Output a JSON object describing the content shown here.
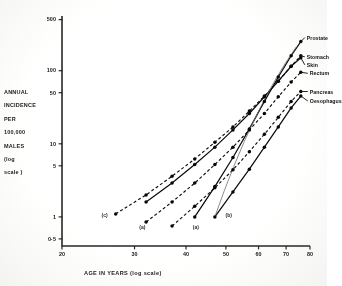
{
  "chart_data": {
    "type": "line",
    "title": "",
    "xlabel": "AGE  IN  YEARS (log scale)",
    "ylabel_lines": [
      "ANNUAL",
      "INCIDENCE",
      "PER",
      "100,000",
      "MALES",
      "(log",
      "scale )"
    ],
    "ylabel_full": "ANNUAL INCIDENCE PER 100,000 MALES (log scale)",
    "xscale": "log",
    "yscale": "log",
    "xlim": [
      20,
      80
    ],
    "ylim": [
      0.4,
      560
    ],
    "grid": false,
    "legend_position": "right-inline",
    "xticks": [
      20,
      30,
      40,
      50,
      60,
      70,
      80
    ],
    "xtick_labels": [
      "20",
      "30",
      "40",
      "50",
      "60",
      "70",
      "80"
    ],
    "yticks": [
      0.5,
      1,
      5,
      10,
      50,
      100,
      500
    ],
    "ytick_labels": [
      "0·5",
      "1",
      "5",
      "10",
      "50",
      "100",
      "500"
    ],
    "annotations": [
      {
        "text": "(c)",
        "x": 25.5,
        "y": 1.05
      },
      {
        "text": "(a)",
        "x": 31.5,
        "y": 0.72
      },
      {
        "text": "(a)",
        "x": 42.5,
        "y": 0.72
      },
      {
        "text": "(b)",
        "x": 51.0,
        "y": 1.05
      }
    ],
    "series": [
      {
        "name": "Prostate",
        "label": "Prostate",
        "style": "solid",
        "marker": "filled-circle",
        "x": [
          42,
          47,
          52,
          57,
          62,
          67,
          72,
          76
        ],
        "values": [
          1.0,
          2.6,
          6.5,
          16,
          38,
          82,
          160,
          250
        ]
      },
      {
        "name": "Stomach",
        "label": "Stomach",
        "style": "dashed",
        "marker": "filled-circle",
        "x": [
          27,
          32,
          37,
          42,
          47,
          52,
          57,
          62,
          67,
          72,
          76
        ],
        "values": [
          1.1,
          2.0,
          3.6,
          6.2,
          10.5,
          17,
          28,
          45,
          72,
          115,
          160
        ]
      },
      {
        "name": "Skin",
        "label": "Skin",
        "style": "solid",
        "marker": "filled-circle",
        "x": [
          32,
          37,
          42,
          47,
          52,
          57,
          62,
          67,
          72,
          76
        ],
        "values": [
          1.6,
          2.9,
          5.2,
          9.0,
          15.5,
          26,
          44,
          72,
          115,
          150
        ]
      },
      {
        "name": "Rectum",
        "label": "Rectum",
        "style": "dashed",
        "marker": "filled-circle",
        "x": [
          32,
          37,
          42,
          47,
          52,
          57,
          62,
          67,
          72,
          76
        ],
        "values": [
          0.85,
          1.6,
          2.9,
          5.2,
          9.0,
          15.5,
          26,
          44,
          70,
          95
        ]
      },
      {
        "name": "Pancreas",
        "label": "Pancreas",
        "style": "dashed",
        "marker": "filled-circle",
        "x": [
          37,
          42,
          47,
          52,
          57,
          62,
          67,
          72,
          76
        ],
        "values": [
          0.75,
          1.4,
          2.5,
          4.4,
          7.8,
          13.5,
          23,
          38,
          52
        ]
      },
      {
        "name": "Oesophagus",
        "label": "Oesophagus",
        "style": "solid",
        "marker": "filled-circle",
        "x": [
          47,
          52,
          57,
          62,
          67,
          72,
          76
        ],
        "values": [
          1.0,
          2.2,
          4.5,
          9.0,
          17,
          31,
          45
        ]
      }
    ]
  }
}
